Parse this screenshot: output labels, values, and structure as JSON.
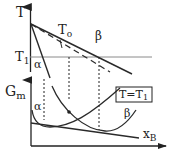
{
  "figure": {
    "type": "phase-diagram-with-gibbs-energy",
    "top_panel": {
      "y_axis_label": "T",
      "tick_label": "T",
      "tick_subscript": "1",
      "curve_labels": {
        "t0": "T",
        "t0_subscript": "o",
        "beta": "β",
        "alpha": "α"
      }
    },
    "bottom_panel": {
      "y_axis_label": "G",
      "y_axis_subscript": "m",
      "x_axis_label": "x",
      "x_axis_subscript": "B",
      "curve_labels": {
        "alpha": "α",
        "beta": "β"
      },
      "condition_box": {
        "prefix": "T=T",
        "subscript": "1"
      }
    },
    "colors": {
      "line": "#2a2a2a",
      "axis": "#222222",
      "t1_line": "#8a8a8a"
    }
  }
}
